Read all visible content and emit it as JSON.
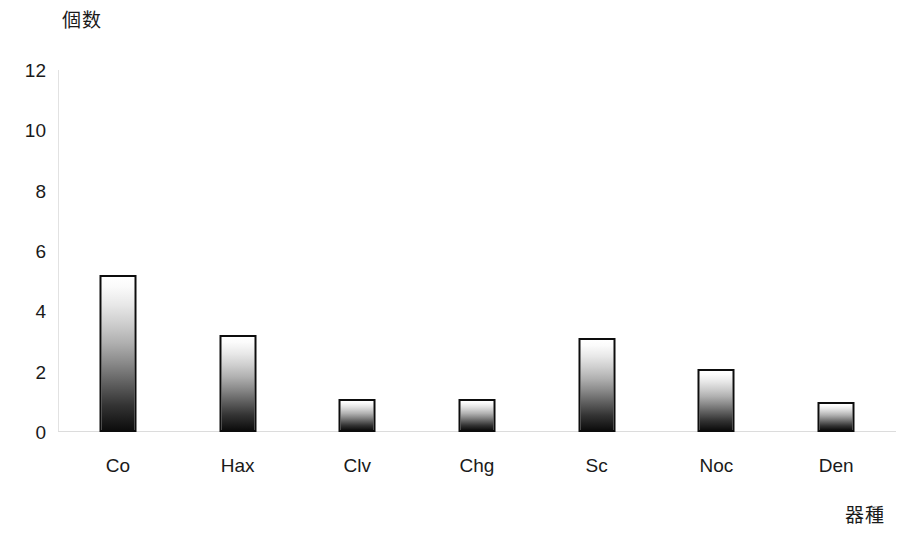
{
  "chart_data": {
    "type": "bar",
    "title": "",
    "xlabel": "器種",
    "ylabel": "個数",
    "categories": [
      "Co",
      "Hax",
      "Clv",
      "Chg",
      "Sc",
      "Noc",
      "Den"
    ],
    "values": [
      5.2,
      3.2,
      1.1,
      1.1,
      3.1,
      2.1,
      1.0
    ],
    "yticks": [
      0,
      2,
      4,
      6,
      8,
      10,
      12
    ],
    "ylim": [
      0,
      12
    ],
    "grid": false,
    "legend": false,
    "series": [
      {
        "name": "個数",
        "values": [
          5.2,
          3.2,
          1.1,
          1.1,
          3.1,
          2.1,
          1.0
        ]
      }
    ],
    "bar_style": {
      "fill": "vertical-gradient-white-to-black",
      "edge_color": "#0d0d0d"
    }
  },
  "axes": {
    "y_title": "個数",
    "x_title": "器種",
    "y_tick_labels": [
      "12",
      "10",
      "8",
      "6",
      "4",
      "2",
      "0"
    ],
    "x_tick_labels": [
      "Co",
      "Hax",
      "Clv",
      "Chg",
      "Sc",
      "Noc",
      "Den"
    ]
  },
  "colors": {
    "background": "#ffffff",
    "text": "#1a1a1a",
    "bar_edge": "#0d0d0d",
    "bar_top": "#ffffff",
    "bar_bottom": "#0d0d0d",
    "axis_line": "#dcdcdc"
  },
  "caption_fragment": ""
}
